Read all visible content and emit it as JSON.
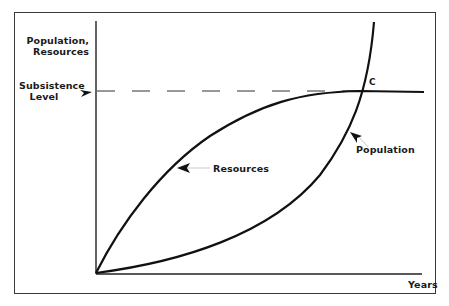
{
  "diagram": {
    "y_axis_label_line1": "Population,",
    "y_axis_label_line2": "Resources",
    "x_axis_label": "Years",
    "subsistence_label_line1": "Subsistence",
    "subsistence_label_line2": "Level",
    "resources_label": "Resources",
    "population_label": "Population",
    "intersection_label": "C",
    "colors": {
      "curve": "#111111",
      "axis": "#222222",
      "dash": "#333333",
      "leader": "#bbbbbb",
      "frame": "#3a3a3a"
    }
  }
}
